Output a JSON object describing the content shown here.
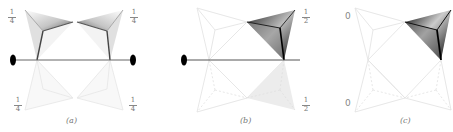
{
  "panels": [
    {
      "id": "a",
      "caption": "(a)",
      "labels": [
        {
          "pos": "top-left",
          "num": "1",
          "den": "4"
        },
        {
          "pos": "top-right",
          "num": "1",
          "den": "4"
        },
        {
          "pos": "bottom-left",
          "num": "1",
          "den": "4"
        },
        {
          "pos": "bottom-right",
          "num": "1",
          "den": "4"
        }
      ]
    },
    {
      "id": "b",
      "caption": "(b)",
      "labels": [
        {
          "pos": "top-right",
          "num": "1",
          "den": "2"
        },
        {
          "pos": "bottom-right",
          "num": "1",
          "den": "2"
        }
      ]
    },
    {
      "id": "c",
      "caption": "(c)",
      "labels": [
        {
          "pos": "top-left",
          "text": "0"
        },
        {
          "pos": "bottom-left",
          "text": "0"
        }
      ]
    }
  ],
  "colors": {
    "line": "#555555",
    "faint": "#e6e6e6",
    "dark": "#111111",
    "shade": "#ececec"
  }
}
